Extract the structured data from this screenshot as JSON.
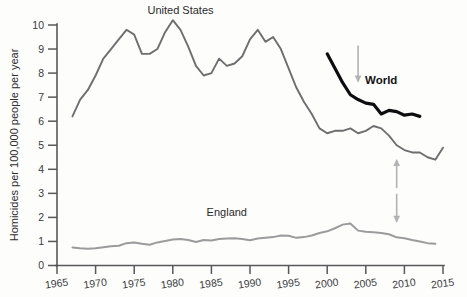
{
  "chart_data": {
    "type": "line",
    "title": "",
    "xlabel": "",
    "ylabel": "Homicides per 100,000 people per year",
    "xlim": [
      1965,
      2015
    ],
    "ylim": [
      0,
      10
    ],
    "grid": false,
    "legend_position": "inline-labels",
    "x_ticks": [
      "1965",
      "1970",
      "1975",
      "1980",
      "1985",
      "1990",
      "1995",
      "2000",
      "2005",
      "2010",
      "2015"
    ],
    "y_ticks": [
      "0",
      "1",
      "2",
      "3",
      "4",
      "5",
      "6",
      "7",
      "8",
      "9",
      "10"
    ],
    "series": [
      {
        "name": "United States",
        "color": "#6e6e70",
        "label_text": "United States",
        "x": [
          1967,
          1968,
          1969,
          1970,
          1971,
          1972,
          1973,
          1974,
          1975,
          1976,
          1977,
          1978,
          1979,
          1980,
          1981,
          1982,
          1983,
          1984,
          1985,
          1986,
          1987,
          1988,
          1989,
          1990,
          1991,
          1992,
          1993,
          1994,
          1995,
          1996,
          1997,
          1998,
          1999,
          2000,
          2001,
          2002,
          2003,
          2004,
          2005,
          2006,
          2007,
          2008,
          2009,
          2010,
          2011,
          2012,
          2013,
          2014,
          2015
        ],
        "values": [
          6.2,
          6.9,
          7.3,
          7.9,
          8.6,
          9.0,
          9.4,
          9.8,
          9.6,
          8.8,
          8.8,
          9.0,
          9.7,
          10.2,
          9.8,
          9.1,
          8.3,
          7.9,
          8.0,
          8.6,
          8.3,
          8.4,
          8.7,
          9.4,
          9.8,
          9.3,
          9.5,
          9.0,
          8.2,
          7.4,
          6.8,
          6.3,
          5.7,
          5.5,
          5.6,
          5.6,
          5.7,
          5.5,
          5.6,
          5.8,
          5.7,
          5.4,
          5.0,
          4.8,
          4.7,
          4.7,
          4.5,
          4.4,
          4.9
        ]
      },
      {
        "name": "England",
        "color": "#9b9b9d",
        "label_text": "England",
        "x": [
          1967,
          1968,
          1969,
          1970,
          1971,
          1972,
          1973,
          1974,
          1975,
          1976,
          1977,
          1978,
          1979,
          1980,
          1981,
          1982,
          1983,
          1984,
          1985,
          1986,
          1987,
          1988,
          1989,
          1990,
          1991,
          1992,
          1993,
          1994,
          1995,
          1996,
          1997,
          1998,
          1999,
          2000,
          2001,
          2002,
          2003,
          2004,
          2005,
          2006,
          2007,
          2008,
          2009,
          2010,
          2011,
          2012,
          2013,
          2014
        ],
        "values": [
          0.75,
          0.72,
          0.7,
          0.72,
          0.76,
          0.8,
          0.82,
          0.93,
          0.96,
          0.9,
          0.86,
          0.96,
          1.02,
          1.08,
          1.1,
          1.06,
          0.98,
          1.06,
          1.04,
          1.1,
          1.12,
          1.13,
          1.1,
          1.05,
          1.12,
          1.15,
          1.18,
          1.25,
          1.24,
          1.15,
          1.18,
          1.25,
          1.35,
          1.42,
          1.55,
          1.7,
          1.75,
          1.45,
          1.4,
          1.38,
          1.35,
          1.3,
          1.17,
          1.13,
          1.06,
          1.0,
          0.93,
          0.9
        ]
      },
      {
        "name": "World",
        "color": "#0d0d0f",
        "label_text": "World",
        "x": [
          2000,
          2001,
          2002,
          2003,
          2004,
          2005,
          2006,
          2007,
          2008,
          2009,
          2010,
          2011,
          2012
        ],
        "values": [
          8.8,
          8.2,
          7.6,
          7.1,
          6.9,
          6.75,
          6.7,
          6.3,
          6.45,
          6.4,
          6.25,
          6.3,
          6.2
        ]
      }
    ],
    "annotations": [
      {
        "name": "us-label",
        "text": "United States",
        "x": 1981,
        "y": 10.45,
        "style": "regular"
      },
      {
        "name": "england-label",
        "text": "England",
        "x": 1987,
        "y": 2.05,
        "style": "regular"
      },
      {
        "name": "world-label",
        "text": "World",
        "x": 2007,
        "y": 7.55,
        "style": "bold"
      },
      {
        "name": "world-pointer-arrow",
        "text": "",
        "direction": "down",
        "x": 2004,
        "y": 8.4
      },
      {
        "name": "gap-arrow-up",
        "text": "",
        "direction": "up",
        "x": 2009,
        "y": 3.8
      },
      {
        "name": "gap-arrow-down",
        "text": "",
        "direction": "down",
        "x": 2009,
        "y": 2.4
      }
    ]
  }
}
